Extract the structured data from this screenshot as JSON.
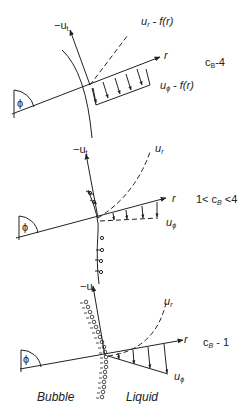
{
  "panels": [
    {
      "id": "panel-cb4",
      "condition": "c_B-4",
      "axis_tangent": "-u_t",
      "axis_radial": "r",
      "angle": "ϕ",
      "ur_label": "u_r - f(r)",
      "uphi_label": "u_ϕ - f(r)"
    },
    {
      "id": "panel-cb-between",
      "condition": "1< c_B <4",
      "axis_tangent": "-u_t",
      "axis_radial": "r",
      "angle": "ϕ",
      "ur_label": "u_r",
      "uphi_label": "u_ϕ"
    },
    {
      "id": "panel-cb1",
      "condition": "c_B - 1",
      "axis_tangent": "-u_t",
      "axis_radial": "r",
      "angle": "ϕ",
      "ur_label": "u_r",
      "uphi_label": "u_ϕ"
    }
  ],
  "regions": {
    "left": "Bubble",
    "right": "Liquid"
  },
  "text": {
    "p0_tan": "−u",
    "p0_tan_sub": "t",
    "p0_ur": "u",
    "p0_ur_sub": "r",
    "p0_ur_rest": " - f(r)",
    "p0_r": "r",
    "p0_uphi": "u",
    "p0_uphi_sub": "ϕ",
    "p0_uphi_rest": " - f(r)",
    "p0_cb": "c",
    "p0_cb_sub": "B",
    "p0_cb_rest": "-4",
    "p0_phi": "ϕ",
    "p1_tan": "−u",
    "p1_tan_sub": "t",
    "p1_ur": "u",
    "p1_ur_sub": "r",
    "p1_r": "r",
    "p1_uphi": "u",
    "p1_uphi_sub": "ϕ",
    "p1_cb_pre": "1< c",
    "p1_cb_sub": "B",
    "p1_cb_rest": " <4",
    "p1_phi": "ϕ",
    "p2_tan": "−u",
    "p2_tan_sub": "t",
    "p2_ur": "u",
    "p2_ur_sub": "r",
    "p2_r": "r",
    "p2_uphi": "u",
    "p2_uphi_sub": "ϕ",
    "p2_cb": "c",
    "p2_cb_sub": "B",
    "p2_cb_rest": " - 1",
    "p2_phi": "ϕ",
    "bubble": "Bubble",
    "liquid": "Liquid"
  }
}
